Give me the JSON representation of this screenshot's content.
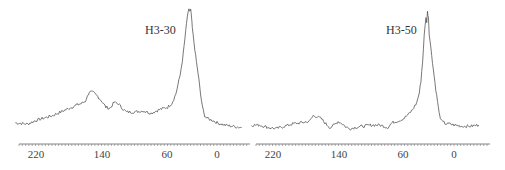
{
  "chart_data": [
    {
      "type": "line",
      "title": "H3-30",
      "xlabel": "",
      "ylabel": "",
      "x_axis_reversed": true,
      "xlim": [
        245,
        -30
      ],
      "tick_labels": [
        "220",
        "140",
        "60",
        "0"
      ],
      "tick_values": [
        220,
        140,
        60,
        0
      ],
      "grid": false,
      "legend": null,
      "series": [
        {
          "name": "H3-30",
          "x": [
            245,
            230,
            220,
            210,
            200,
            190,
            180,
            170,
            165,
            160,
            155,
            150,
            145,
            140,
            135,
            130,
            125,
            120,
            115,
            110,
            100,
            90,
            80,
            70,
            60,
            55,
            50,
            45,
            42,
            40,
            38,
            36,
            34,
            33,
            32,
            31,
            30,
            28,
            26,
            24,
            22,
            20,
            18,
            15,
            12,
            10,
            5,
            0,
            -10,
            -20,
            -30
          ],
          "y": [
            0.06,
            0.05,
            0.08,
            0.1,
            0.12,
            0.15,
            0.18,
            0.21,
            0.22,
            0.24,
            0.32,
            0.31,
            0.28,
            0.24,
            0.19,
            0.18,
            0.23,
            0.22,
            0.18,
            0.15,
            0.15,
            0.16,
            0.14,
            0.17,
            0.19,
            0.22,
            0.3,
            0.45,
            0.58,
            0.7,
            0.82,
            0.95,
            1.0,
            0.99,
            1.0,
            0.94,
            0.85,
            0.73,
            0.62,
            0.52,
            0.42,
            0.3,
            0.2,
            0.12,
            0.1,
            0.09,
            0.08,
            0.06,
            0.04,
            0.03,
            0.02
          ]
        }
      ]
    },
    {
      "type": "line",
      "title": "H3-50",
      "xlabel": "",
      "ylabel": "",
      "x_axis_reversed": true,
      "xlim": [
        245,
        -30
      ],
      "tick_labels": [
        "220",
        "140",
        "60",
        "0"
      ],
      "tick_values": [
        220,
        140,
        60,
        0
      ],
      "grid": false,
      "legend": null,
      "series": [
        {
          "name": "H3-50",
          "x": [
            245,
            235,
            225,
            215,
            205,
            195,
            185,
            175,
            170,
            165,
            160,
            155,
            150,
            145,
            140,
            135,
            130,
            125,
            120,
            110,
            100,
            90,
            80,
            75,
            70,
            65,
            60,
            55,
            50,
            45,
            42,
            40,
            38,
            36,
            34,
            33,
            32,
            31,
            30,
            28,
            26,
            24,
            22,
            20,
            18,
            15,
            12,
            10,
            5,
            0,
            -10,
            -20,
            -30
          ],
          "y": [
            0.05,
            0.05,
            0.03,
            0.02,
            0.04,
            0.06,
            0.07,
            0.08,
            0.13,
            0.12,
            0.1,
            0.06,
            0.03,
            0.05,
            0.08,
            0.06,
            0.03,
            0.02,
            0.03,
            0.04,
            0.05,
            0.05,
            0.03,
            0.07,
            0.08,
            0.09,
            0.11,
            0.14,
            0.18,
            0.24,
            0.32,
            0.42,
            0.58,
            0.8,
            0.96,
            0.92,
            1.0,
            0.96,
            0.82,
            0.7,
            0.58,
            0.46,
            0.35,
            0.25,
            0.15,
            0.08,
            0.07,
            0.06,
            0.06,
            0.05,
            0.04,
            0.04,
            0.05
          ]
        }
      ]
    }
  ],
  "labels": {
    "left_title": "H3-30",
    "right_title": "H3-50",
    "left_ticks": [
      "220",
      "140",
      "60",
      "0"
    ],
    "right_ticks": [
      "220",
      "140",
      "60",
      "0"
    ]
  }
}
